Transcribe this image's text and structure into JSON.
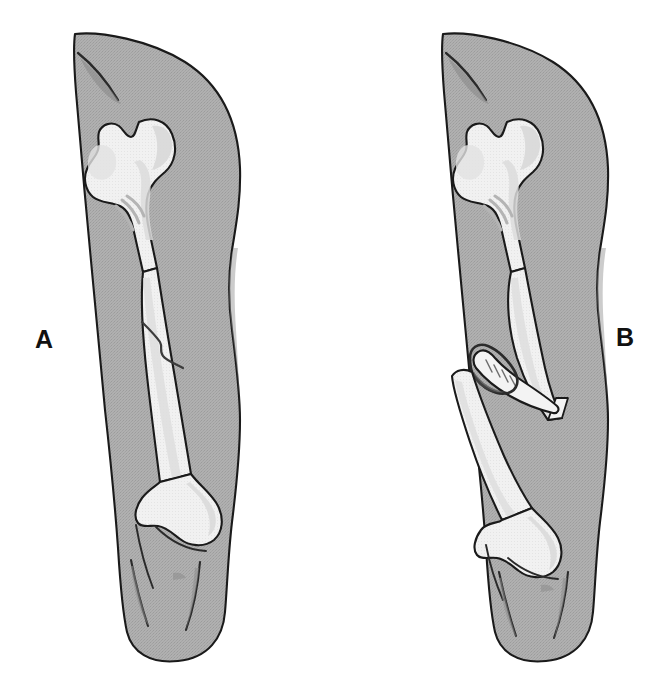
{
  "figure": {
    "background_color": "#ffffff",
    "width": 664,
    "height": 688,
    "caption_fragment": ""
  },
  "palette": {
    "skin_fill": "#ababab",
    "skin_fill_shadow": "#9d9d9d",
    "bone_fill": "#f1f1f1",
    "bone_shade": "#dedede",
    "trabecular": "#d2d2d2",
    "outline": "#1a1a1a",
    "crease": "#555555",
    "wound_dark": "#3a3a3a",
    "label_color": "#111111"
  },
  "panels": [
    {
      "id": "A",
      "label": "A",
      "label_x": 46,
      "label_y": 340,
      "fracture_type": "closed-simple-fracture",
      "description": "Thigh with intact skin and an oblique crack in the mid femoral shaft",
      "skin_intact": true,
      "bone_displaced": false,
      "anatomy": [
        "groin-crease",
        "femoral-head",
        "femoral-neck",
        "greater-trochanter",
        "lesser-trochanter",
        "femoral-shaft",
        "fracture-line",
        "medial-condyle",
        "lateral-condyle",
        "knee-crease"
      ]
    },
    {
      "id": "B",
      "label": "B",
      "label_x": 625,
      "label_y": 338,
      "fracture_type": "open-compound-fracture",
      "description": "Thigh with a displaced femoral shaft fracture; the sharp bone fragment pierces the skin through an open wound",
      "skin_intact": false,
      "bone_displaced": true,
      "anatomy": [
        "groin-crease",
        "femoral-head",
        "femoral-neck",
        "greater-trochanter",
        "lesser-trochanter",
        "proximal-fragment",
        "fracture-gap",
        "protruding-bone-spike",
        "skin-wound",
        "distal-fragment",
        "medial-condyle",
        "lateral-condyle",
        "knee-crease"
      ]
    }
  ]
}
